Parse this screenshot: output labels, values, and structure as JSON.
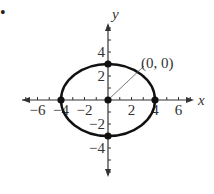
{
  "bullet": "•",
  "chart_data": {
    "type": "scatter",
    "title": "",
    "xlabel": "x",
    "ylabel": "y",
    "xlim": [
      -7,
      7
    ],
    "ylim": [
      -6,
      6
    ],
    "x_ticks": [
      -6,
      -4,
      -2,
      2,
      4,
      6
    ],
    "y_ticks": [
      -4,
      -2,
      2,
      4
    ],
    "curve": {
      "shape": "ellipse",
      "center": [
        0,
        0
      ],
      "semi_x": 4,
      "semi_y": 3
    },
    "points": [
      [
        0,
        0
      ],
      [
        -4,
        0
      ],
      [
        4,
        0
      ],
      [
        0,
        3
      ],
      [
        0,
        -3
      ]
    ],
    "annotation": {
      "text": "(0, 0)",
      "points_to": [
        0,
        0
      ]
    },
    "grid": false
  }
}
